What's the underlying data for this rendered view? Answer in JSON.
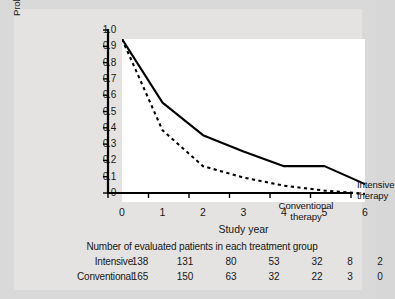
{
  "chart_data": {
    "type": "line",
    "title": "",
    "xlabel": "Study year",
    "ylabel": "Probability of maintaining C-peptide level > 0.2 pmol/mL",
    "ylabel_line1": "Probability of maintaining C-peptide",
    "ylabel_line2": "level > 0.2 pmol/mL",
    "x": [
      0,
      1,
      2,
      3,
      4,
      5,
      6
    ],
    "xlim": [
      0,
      6
    ],
    "ylim": [
      0,
      1.0
    ],
    "xtick_labels": [
      "0",
      "1",
      "2",
      "3",
      "4",
      "5",
      "6"
    ],
    "ytick_labels": [
      "1.0",
      "0.9",
      "0.8",
      "0.7",
      "0.6",
      "0.5",
      "0.4",
      "0.3",
      "0.2",
      "0.1",
      "0"
    ],
    "ytick_values": [
      1.0,
      0.9,
      0.8,
      0.7,
      0.6,
      0.5,
      0.4,
      0.3,
      0.2,
      0.1,
      0
    ],
    "grid": false,
    "legend_position": "inline-annotation",
    "series": [
      {
        "name": "Intensive therapy",
        "style": "solid",
        "color": "#000000",
        "values": [
          1.0,
          0.61,
          0.41,
          0.31,
          0.22,
          0.22,
          0.11
        ]
      },
      {
        "name": "Conventional therapy",
        "style": "dashed",
        "color": "#000000",
        "values": [
          1.0,
          0.44,
          0.22,
          0.15,
          0.1,
          0.07,
          0.05
        ]
      }
    ],
    "annotations": [
      {
        "text": "Intensive therapy",
        "series": "Intensive therapy"
      },
      {
        "text": "Conventional",
        "series": "Conventional therapy"
      },
      {
        "text": "therapy",
        "series": "Conventional therapy"
      }
    ]
  },
  "annotations": {
    "intensive_note": "Intensive therapy",
    "conventional_note_line1": "Conventional",
    "conventional_note_line2": "therapy"
  },
  "table": {
    "title": "Number of evaluated patients in each treatment group",
    "rows": [
      {
        "label": "Intensive",
        "values": [
          "138",
          "131",
          "80",
          "53",
          "32",
          "8",
          "2"
        ]
      },
      {
        "label": "Conventional",
        "values": [
          "165",
          "150",
          "63",
          "32",
          "22",
          "3",
          "0"
        ]
      }
    ]
  },
  "colors": {
    "figure_background": "#d9d9d9",
    "inner_background": "#e4e3e1",
    "panel_background": "#ffffff",
    "axis": "#000000",
    "text": "#171717"
  }
}
